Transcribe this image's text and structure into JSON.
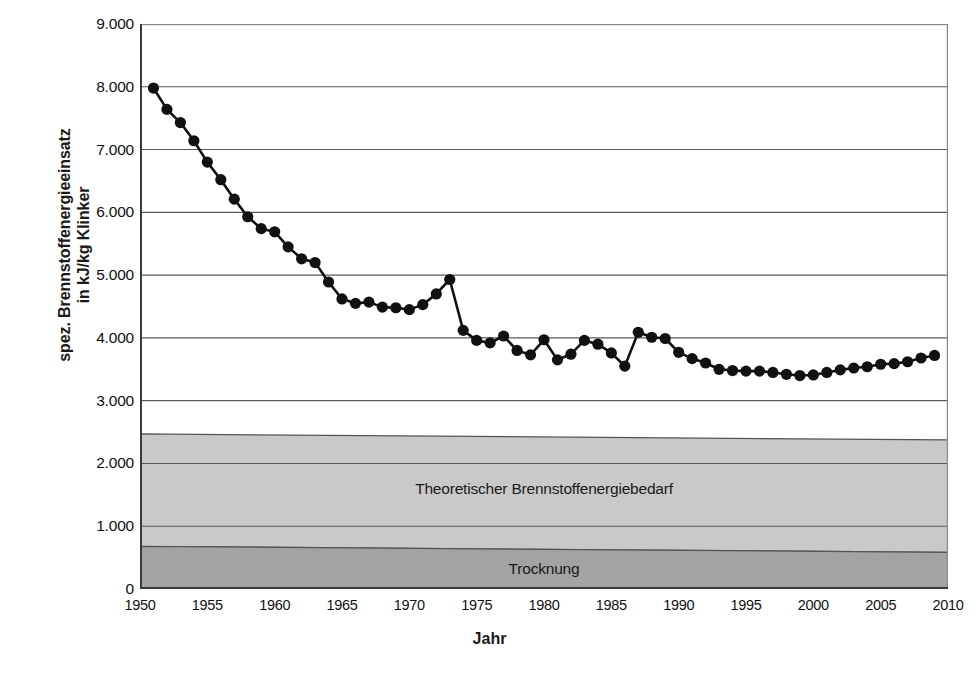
{
  "chart_data": {
    "type": "line",
    "title": "",
    "xlabel": "Jahr",
    "ylabel": "spez. Brennstoffenergieeinsatz in kJ/kg Klinker",
    "ylabel_line1": "spez. Brennstoffenergieeinsatz",
    "ylabel_line2": "in kJ/kg Klinker",
    "xlim": [
      1950,
      2010
    ],
    "ylim": [
      0,
      9000
    ],
    "xticks": [
      1950,
      1955,
      1960,
      1965,
      1970,
      1975,
      1980,
      1985,
      1990,
      1995,
      2000,
      2005,
      2010
    ],
    "xtick_labels": [
      "1950",
      "1955",
      "1960",
      "1965",
      "1970",
      "1975",
      "1980",
      "1985",
      "1990",
      "1995",
      "2000",
      "2005",
      "2010"
    ],
    "yticks": [
      0,
      1000,
      2000,
      3000,
      4000,
      5000,
      6000,
      7000,
      8000,
      9000
    ],
    "ytick_labels": [
      "0",
      "1.000",
      "2.000",
      "3.000",
      "4.000",
      "5.000",
      "6.000",
      "7.000",
      "8.000",
      "9.000"
    ],
    "grid": true,
    "grid_axis": "y",
    "legend": "none",
    "marker": "filled-circle",
    "line_color": "#111111",
    "marker_color": "#111111",
    "series": [
      {
        "name": "spez. Brennstoffenergieeinsatz",
        "x": [
          1951,
          1952,
          1953,
          1954,
          1955,
          1956,
          1957,
          1958,
          1959,
          1960,
          1961,
          1962,
          1963,
          1964,
          1965,
          1966,
          1967,
          1968,
          1969,
          1970,
          1971,
          1972,
          1973,
          1974,
          1975,
          1976,
          1977,
          1978,
          1979,
          1980,
          1981,
          1982,
          1983,
          1984,
          1985,
          1986,
          1987,
          1988,
          1989,
          1990,
          1991,
          1992,
          1993,
          1994,
          1995,
          1996,
          1997,
          1998,
          1999,
          2000,
          2001,
          2002,
          2003,
          2004,
          2005,
          2006,
          2007,
          2008,
          2009
        ],
        "values": [
          7980,
          7640,
          7430,
          7140,
          6800,
          6520,
          6210,
          5930,
          5740,
          5690,
          5450,
          5260,
          5200,
          4890,
          4620,
          4550,
          4570,
          4490,
          4480,
          4450,
          4530,
          4700,
          4930,
          4120,
          3960,
          3920,
          4030,
          3800,
          3730,
          3970,
          3650,
          3740,
          3960,
          3900,
          3760,
          3550,
          4090,
          4010,
          3990,
          3770,
          3670,
          3600,
          3500,
          3480,
          3470,
          3470,
          3450,
          3420,
          3400,
          3410,
          3450,
          3490,
          3520,
          3540,
          3580,
          3590,
          3620,
          3680,
          3720
        ]
      }
    ],
    "bands": [
      {
        "name": "Theoretischer Brennstoffenergiebedarf",
        "label": "Theoretischer Brennstoffenergiebedarf",
        "y_from": 680,
        "y_to": 2470,
        "color": "#c9c9c9"
      },
      {
        "name": "Trocknung",
        "label": "Trocknung",
        "y_from": 0,
        "y_to": 680,
        "color": "#a3a3a3"
      }
    ]
  },
  "axes": {
    "x_title": "Jahr",
    "y_title_line1": "spez. Brennstoffenergieeinsatz",
    "y_title_line2": "in kJ/kg Klinker"
  },
  "colors": {
    "band_light": "#c9c9c9",
    "band_dark": "#a3a3a3",
    "grid": "#5a5a5a",
    "axis": "#3a3a3a",
    "line": "#111111"
  }
}
